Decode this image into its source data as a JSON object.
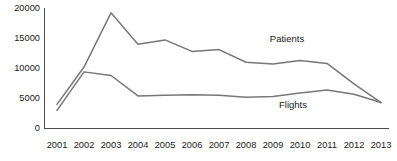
{
  "chart_data": {
    "type": "line",
    "title": "",
    "subtitle": "",
    "xlabel": "",
    "ylabel": "",
    "x": [
      2001,
      2002,
      2003,
      2004,
      2005,
      2006,
      2007,
      2008,
      2009,
      2010,
      2011,
      2012,
      2013
    ],
    "categories": [
      "2001",
      "2002",
      "2003",
      "2004",
      "2005",
      "2006",
      "2007",
      "2008",
      "2009",
      "2010",
      "2011",
      "2012",
      "2013"
    ],
    "series": [
      {
        "name": "Patients",
        "values": [
          4000,
          10200,
          19200,
          14000,
          14700,
          12800,
          13100,
          11000,
          10700,
          11300,
          10800,
          7400,
          4300
        ]
      },
      {
        "name": "Flights",
        "values": [
          3000,
          9400,
          8800,
          5400,
          5500,
          5600,
          5500,
          5200,
          5300,
          5900,
          6400,
          5700,
          4300
        ]
      }
    ],
    "ylim": [
      0,
      20000
    ],
    "yticks": [
      0,
      5000,
      10000,
      15000,
      20000
    ],
    "ytick_labels": [
      "0",
      "5000",
      "10000",
      "15000",
      "20000"
    ],
    "xlim": [
      2001,
      2013
    ],
    "grid": false,
    "legend_position": "inline-annotations",
    "annotations": [
      {
        "text": "Patients",
        "x": 2009,
        "y": 15300
      },
      {
        "text": "Flights",
        "x": 2009.3,
        "y": 4600
      }
    ],
    "colors": {
      "series_line": "#77777a",
      "axis": "#4d4d4d",
      "text": "#1a1a1a",
      "background": "#ffffff"
    }
  },
  "axes": {
    "y_labels": [
      "20000",
      "15000",
      "10000",
      "5000",
      "0"
    ],
    "x_labels": [
      "2001",
      "2002",
      "2003",
      "2004",
      "2005",
      "2006",
      "2007",
      "2008",
      "2009",
      "2010",
      "2011",
      "2012",
      "2013"
    ]
  },
  "labels": {
    "patients": "Patients",
    "flights": "Flights"
  }
}
